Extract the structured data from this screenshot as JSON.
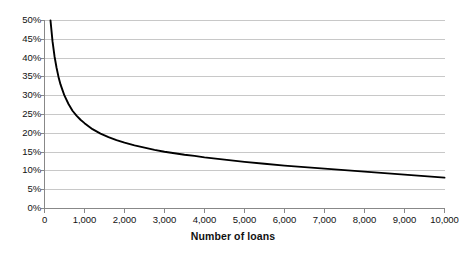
{
  "chart_data": {
    "type": "line",
    "title": "",
    "subtitle": "",
    "xlabel": "Number of loans",
    "ylabel": "",
    "xlim": [
      0,
      10000
    ],
    "ylim": [
      0,
      0.5
    ],
    "grid": true,
    "legend": false,
    "series": [
      {
        "name": "",
        "color": "#000000",
        "x": [
          150,
          200,
          250,
          300,
          350,
          400,
          450,
          500,
          600,
          700,
          800,
          900,
          1000,
          1200,
          1400,
          1600,
          1800,
          2000,
          2250,
          2500,
          2750,
          3000,
          3250,
          3500,
          3750,
          4000,
          4500,
          5000,
          5500,
          6000,
          6500,
          7000,
          7500,
          8000,
          8500,
          9000,
          9500,
          10000
        ],
        "y": [
          50.0,
          44.5,
          40.5,
          37.5,
          35.0,
          33.0,
          31.5,
          30.0,
          27.8,
          26.0,
          24.7,
          23.6,
          22.7,
          21.1,
          19.9,
          19.0,
          18.2,
          17.5,
          16.8,
          16.2,
          15.6,
          15.1,
          14.7,
          14.3,
          14.0,
          13.6,
          13.0,
          12.4,
          11.9,
          11.4,
          11.0,
          10.6,
          10.2,
          9.8,
          9.4,
          9.0,
          8.6,
          8.2
        ]
      }
    ],
    "y_ticks": [
      {
        "value": 0,
        "label": "0%"
      },
      {
        "value": 5,
        "label": "5%"
      },
      {
        "value": 10,
        "label": "10%"
      },
      {
        "value": 15,
        "label": "15%"
      },
      {
        "value": 20,
        "label": "20%"
      },
      {
        "value": 25,
        "label": "25%"
      },
      {
        "value": 30,
        "label": "30%"
      },
      {
        "value": 35,
        "label": "35%"
      },
      {
        "value": 40,
        "label": "40%"
      },
      {
        "value": 45,
        "label": "45%"
      },
      {
        "value": 50,
        "label": "50%"
      }
    ],
    "x_ticks": [
      {
        "value": 0,
        "label": "0"
      },
      {
        "value": 1000,
        "label": "1,000"
      },
      {
        "value": 2000,
        "label": "2,000"
      },
      {
        "value": 3000,
        "label": "3,000"
      },
      {
        "value": 4000,
        "label": "4,000"
      },
      {
        "value": 5000,
        "label": "5,000"
      },
      {
        "value": 6000,
        "label": "6,000"
      },
      {
        "value": 7000,
        "label": "7,000"
      },
      {
        "value": 8000,
        "label": "8,000"
      },
      {
        "value": 9000,
        "label": "9,000"
      },
      {
        "value": 10000,
        "label": "10,000"
      }
    ],
    "colors": {
      "line": "#111111",
      "grid": "#c8c8c8",
      "axis": "#888888",
      "background": "#ffffff",
      "text": "#111111"
    }
  }
}
